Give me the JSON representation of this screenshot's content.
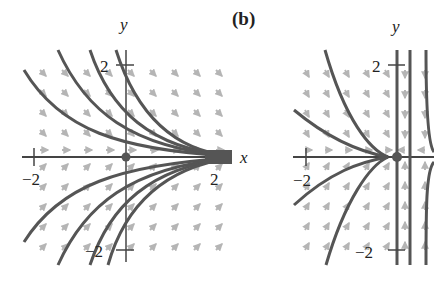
{
  "figure": {
    "panel_b_label": "(b)",
    "panel_a": {
      "x_axis_label": "x",
      "y_axis_label": "y",
      "tick_labels": {
        "x_neg": "−2",
        "x_pos": "2",
        "y_pos": "2",
        "y_neg": "−2"
      },
      "equilibrium": "origin",
      "description": "Phase portrait: trajectories converge toward positive x-axis"
    },
    "panel_b": {
      "x_axis_label": "x",
      "y_axis_label": "y",
      "tick_labels": {
        "x_neg": "−2",
        "y_pos": "2",
        "y_neg": "−2"
      },
      "equilibrium": "origin",
      "description": "Phase portrait: saddle-like behavior near origin"
    },
    "colors": {
      "trajectory": "#555555",
      "vector_field": "#b5b5b5",
      "axis": "#444444"
    }
  }
}
